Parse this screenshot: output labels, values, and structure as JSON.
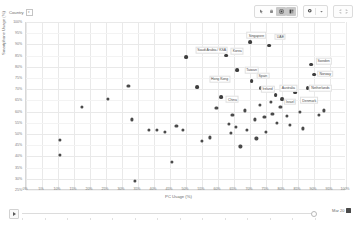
{
  "toolbar": {
    "groups": [
      {
        "name": "view-group",
        "buttons": [
          {
            "icon": "pointer-icon",
            "glyph": "↖",
            "active": false
          },
          {
            "icon": "pan-hand-icon",
            "glyph": "✋",
            "active": false
          },
          {
            "icon": "zoom-area-icon",
            "glyph": "▣",
            "active": true
          },
          {
            "icon": "lasso-select-icon",
            "glyph": "⧉",
            "active": true
          }
        ]
      },
      {
        "name": "settings-group",
        "buttons": [
          {
            "icon": "gear-icon",
            "glyph": "⚙",
            "active": false
          },
          {
            "icon": "chevron-down-icon",
            "glyph": "▾",
            "active": false
          }
        ]
      },
      {
        "name": "fullscreen-group",
        "buttons": [
          {
            "icon": "expand-icon",
            "glyph": "⤢",
            "active": false
          }
        ]
      }
    ]
  },
  "country_selector": {
    "label": "Country",
    "filter_glyph": "▾"
  },
  "player": {
    "play_label": "play",
    "date_label": "Mar 20"
  },
  "chart_data": {
    "type": "scatter",
    "title": "",
    "xlabel": "PC Usage (%)",
    "ylabel": "Smartphone Usage (%)",
    "xlim": [
      0,
      100
    ],
    "ylim": [
      25,
      100
    ],
    "grid": true,
    "legend": "none",
    "xticks": [
      "0%",
      "5%",
      "10%",
      "15%",
      "20%",
      "25%",
      "30%",
      "35%",
      "40%",
      "45%",
      "50%",
      "55%",
      "60%",
      "65%",
      "70%",
      "75%",
      "80%",
      "85%",
      "90%",
      "95%",
      "100%"
    ],
    "yticks": [
      "100%",
      "95%",
      "90%",
      "85%",
      "80%",
      "75%",
      "70%",
      "65%",
      "60%",
      "55%",
      "50%",
      "45%",
      "40%",
      "35%",
      "30%",
      "25%"
    ],
    "points": [
      {
        "x": 10.5,
        "y": 47.5,
        "label": ""
      },
      {
        "x": 10.5,
        "y": 40.5,
        "label": ""
      },
      {
        "x": 17.5,
        "y": 62.0,
        "label": ""
      },
      {
        "x": 25.5,
        "y": 65.5,
        "label": ""
      },
      {
        "x": 32.0,
        "y": 71.5,
        "label": ""
      },
      {
        "x": 33.0,
        "y": 56.5,
        "label": ""
      },
      {
        "x": 34.0,
        "y": 29.0,
        "label": ""
      },
      {
        "x": 38.5,
        "y": 52.0,
        "label": ""
      },
      {
        "x": 41.0,
        "y": 52.0,
        "label": ""
      },
      {
        "x": 43.5,
        "y": 51.0,
        "label": ""
      },
      {
        "x": 45.5,
        "y": 37.5,
        "label": ""
      },
      {
        "x": 47.0,
        "y": 53.5,
        "label": ""
      },
      {
        "x": 49.0,
        "y": 52.0,
        "label": ""
      },
      {
        "x": 50.0,
        "y": 84.5,
        "label": "Saudi Arabia / KSA",
        "lx": 58.0,
        "ly": 87.5
      },
      {
        "x": 53.5,
        "y": 71.0,
        "label": "Hong Kong",
        "lx": 60.5,
        "ly": 74.5
      },
      {
        "x": 55.0,
        "y": 47.0,
        "label": ""
      },
      {
        "x": 57.5,
        "y": 48.5,
        "label": ""
      },
      {
        "x": 59.5,
        "y": 61.5,
        "label": ""
      },
      {
        "x": 61.0,
        "y": 66.5,
        "label": "China",
        "lx": 64.5,
        "ly": 65.5
      },
      {
        "x": 62.5,
        "y": 85.0,
        "label": "Korea",
        "lx": 66.0,
        "ly": 87.0
      },
      {
        "x": 63.5,
        "y": 54.5,
        "label": ""
      },
      {
        "x": 64.0,
        "y": 50.5,
        "label": ""
      },
      {
        "x": 64.5,
        "y": 58.5,
        "label": ""
      },
      {
        "x": 65.5,
        "y": 53.0,
        "label": ""
      },
      {
        "x": 66.0,
        "y": 78.5,
        "label": "Taiwan",
        "lx": 70.5,
        "ly": 78.5
      },
      {
        "x": 67.0,
        "y": 44.5,
        "label": ""
      },
      {
        "x": 68.5,
        "y": 60.5,
        "label": ""
      },
      {
        "x": 69.0,
        "y": 52.0,
        "label": ""
      },
      {
        "x": 70.0,
        "y": 91.0,
        "label": "Singapore",
        "lx": 72.0,
        "ly": 94.0
      },
      {
        "x": 70.5,
        "y": 73.5,
        "label": "Spain",
        "lx": 74.0,
        "ly": 76.0
      },
      {
        "x": 71.5,
        "y": 56.5,
        "label": ""
      },
      {
        "x": 72.0,
        "y": 48.0,
        "label": ""
      },
      {
        "x": 73.0,
        "y": 63.0,
        "label": ""
      },
      {
        "x": 73.5,
        "y": 70.5,
        "label": "Ireland",
        "lx": 75.5,
        "ly": 70.0
      },
      {
        "x": 74.5,
        "y": 57.5,
        "label": ""
      },
      {
        "x": 75.0,
        "y": 51.0,
        "label": ""
      },
      {
        "x": 76.0,
        "y": 89.5,
        "label": "UAE",
        "lx": 79.5,
        "ly": 93.5
      },
      {
        "x": 76.5,
        "y": 64.5,
        "label": ""
      },
      {
        "x": 77.0,
        "y": 59.0,
        "label": ""
      },
      {
        "x": 78.0,
        "y": 67.5,
        "label": "Australia",
        "lx": 82.0,
        "ly": 70.5
      },
      {
        "x": 78.5,
        "y": 55.0,
        "label": ""
      },
      {
        "x": 79.5,
        "y": 62.0,
        "label": ""
      },
      {
        "x": 80.0,
        "y": 65.5,
        "label": "Israel",
        "lx": 82.5,
        "ly": 64.5
      },
      {
        "x": 81.5,
        "y": 58.0,
        "label": ""
      },
      {
        "x": 82.5,
        "y": 54.0,
        "label": ""
      },
      {
        "x": 83.5,
        "y": 64.5,
        "label": ""
      },
      {
        "x": 84.0,
        "y": 68.5,
        "label": "Denmark",
        "lx": 88.5,
        "ly": 65.0
      },
      {
        "x": 85.5,
        "y": 60.0,
        "label": ""
      },
      {
        "x": 86.5,
        "y": 52.5,
        "label": ""
      },
      {
        "x": 88.0,
        "y": 70.5,
        "label": "Netherlands",
        "lx": 92.0,
        "ly": 70.5
      },
      {
        "x": 89.0,
        "y": 81.0,
        "label": "Sweden",
        "lx": 93.0,
        "ly": 82.5
      },
      {
        "x": 90.0,
        "y": 76.5,
        "label": "Norway",
        "lx": 93.5,
        "ly": 77.0
      },
      {
        "x": 91.5,
        "y": 58.5,
        "label": ""
      },
      {
        "x": 93.0,
        "y": 60.5,
        "label": ""
      }
    ]
  }
}
